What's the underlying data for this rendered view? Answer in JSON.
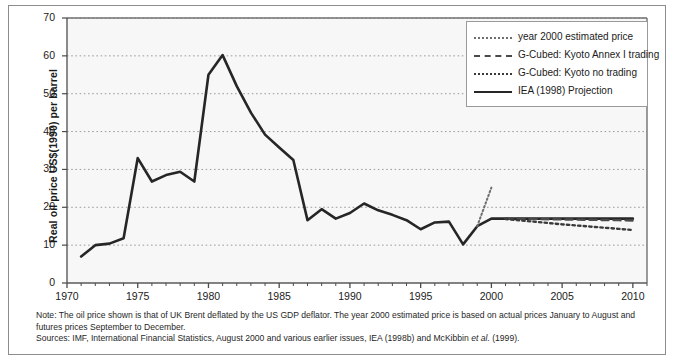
{
  "figure": {
    "y_axis_title": "Real oil price US$(1990) per barrel"
  },
  "legend": {
    "items": [
      {
        "label": "year 2000 estimated price",
        "style": "dotted-fine",
        "color": "#6f6f6f"
      },
      {
        "label": "G-Cubed: Kyoto Annex I trading",
        "style": "dashed",
        "color": "#4a4a4a"
      },
      {
        "label": "G-Cubed: Kyoto no trading",
        "style": "dotted",
        "color": "#3a3a3a"
      },
      {
        "label": "IEA (1998) Projection",
        "style": "solid",
        "color": "#262626"
      }
    ]
  },
  "footnote": {
    "note_line1": "Note: The oil price shown is that of UK Brent deflated by the US GDP deflator. The year 2000 estimated price is based on actual prices January to August and",
    "note_line2": "futures prices September to December.",
    "sources_prefix": "Sources: IMF, International Financial Statistics, August 2000 and various earlier issues, IEA (1998b) and McKibbin ",
    "sources_italic": "et al.",
    "sources_suffix": " (1999)."
  },
  "chart_data": {
    "type": "line",
    "title": "",
    "xlabel": "",
    "ylabel": "Real oil price US$(1990) per barrel",
    "xlim": [
      1970,
      2011
    ],
    "ylim": [
      0,
      70
    ],
    "ytick_values": [
      0,
      10,
      20,
      30,
      40,
      50,
      60,
      70
    ],
    "xtick_values": [
      1970,
      1975,
      1980,
      1985,
      1990,
      1995,
      2000,
      2005,
      2010
    ],
    "xtick_minor_step": 1,
    "grid": "horizontal-dotted",
    "legend_position": "top-right",
    "series": [
      {
        "name": "IEA (1998) Projection",
        "style": "solid",
        "color": "#262626",
        "x": [
          1971,
          1972,
          1973,
          1974,
          1975,
          1976,
          1977,
          1978,
          1979,
          1980,
          1981,
          1982,
          1983,
          1984,
          1985,
          1986,
          1987,
          1988,
          1989,
          1990,
          1991,
          1992,
          1993,
          1994,
          1995,
          1996,
          1997,
          1998,
          1999,
          2000,
          2001,
          2002,
          2003,
          2004,
          2005,
          2006,
          2007,
          2008,
          2009,
          2010
        ],
        "values": [
          7.0,
          10.0,
          10.4,
          11.8,
          33.0,
          26.8,
          28.5,
          29.4,
          26.8,
          55.0,
          60.2,
          52.0,
          45.0,
          39.2,
          35.8,
          32.5,
          16.6,
          19.5,
          17.0,
          18.5,
          21.0,
          19.2,
          18.0,
          16.6,
          14.2,
          16.0,
          16.2,
          10.2,
          15.0,
          17.0,
          17.0,
          17.0,
          17.0,
          17.0,
          17.0,
          17.0,
          17.0,
          17.0,
          17.0,
          17.0
        ]
      },
      {
        "name": "year 2000 estimated price",
        "style": "dotted-fine",
        "color": "#6f6f6f",
        "x": [
          1999,
          2000
        ],
        "values": [
          15.0,
          25.2
        ]
      },
      {
        "name": "G-Cubed: Kyoto Annex I trading",
        "style": "dashed",
        "color": "#4a4a4a",
        "x": [
          2001,
          2003,
          2005,
          2007,
          2009,
          2010
        ],
        "values": [
          17.0,
          16.9,
          16.8,
          16.7,
          16.6,
          16.5
        ]
      },
      {
        "name": "G-Cubed: Kyoto no trading",
        "style": "dotted",
        "color": "#3a3a3a",
        "x": [
          2001,
          2003,
          2005,
          2007,
          2009,
          2010
        ],
        "values": [
          16.9,
          16.2,
          15.5,
          14.9,
          14.3,
          14.0
        ]
      }
    ]
  }
}
